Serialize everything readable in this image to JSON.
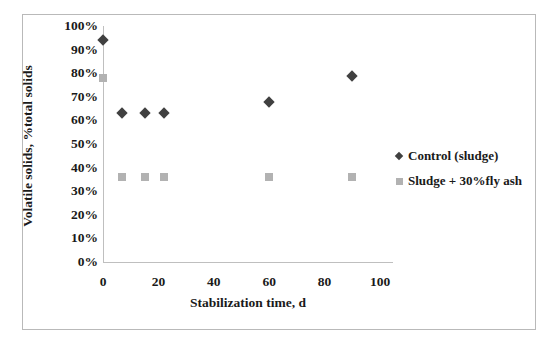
{
  "chart_data": {
    "type": "scatter",
    "title": "",
    "xlabel": "Stabilization time, d",
    "ylabel": "Volatile solids, %total solids",
    "xlim": [
      0,
      100
    ],
    "ylim": [
      0,
      100
    ],
    "x_ticks": [
      "0",
      "20",
      "40",
      "60",
      "80",
      "100"
    ],
    "x_tick_values": [
      0,
      20,
      40,
      60,
      80,
      100
    ],
    "y_ticks": [
      "0%",
      "10%",
      "20%",
      "30%",
      "40%",
      "50%",
      "60%",
      "70%",
      "80%",
      "90%",
      "100%"
    ],
    "y_tick_values": [
      0,
      10,
      20,
      30,
      40,
      50,
      60,
      70,
      80,
      90,
      100
    ],
    "grid": false,
    "legend_position": "right",
    "series": [
      {
        "name": "Control (sludge)",
        "marker": "diamond",
        "color": "#404040",
        "points": [
          {
            "x": 0,
            "y": 94
          },
          {
            "x": 7,
            "y": 63
          },
          {
            "x": 15,
            "y": 63
          },
          {
            "x": 22,
            "y": 63
          },
          {
            "x": 60,
            "y": 68
          },
          {
            "x": 90,
            "y": 79
          }
        ]
      },
      {
        "name": "Sludge + 30%fly ash",
        "marker": "square",
        "color": "#b2b2b2",
        "points": [
          {
            "x": 0,
            "y": 78
          },
          {
            "x": 7,
            "y": 36
          },
          {
            "x": 15,
            "y": 36
          },
          {
            "x": 22,
            "y": 36
          },
          {
            "x": 60,
            "y": 36
          },
          {
            "x": 90,
            "y": 36
          }
        ]
      }
    ]
  },
  "legend": {
    "items": [
      {
        "label": "Control (sludge)",
        "marker": "diamond"
      },
      {
        "label": "Sludge + 30%fly ash",
        "marker": "square"
      }
    ]
  }
}
